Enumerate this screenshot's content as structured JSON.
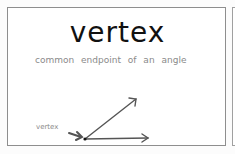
{
  "card": {
    "title": "vertex",
    "subtitle": "common endpoint of an angle",
    "diagram": {
      "label": "vertex",
      "label_pointer": "arrow-pointing-to-vertex",
      "vertex_point": {
        "x": 84,
        "y": 138
      },
      "rays": [
        {
          "name": "upper-ray",
          "to": {
            "x": 135,
            "y": 97
          }
        },
        {
          "name": "lower-ray",
          "to": {
            "x": 147,
            "y": 137
          }
        }
      ]
    }
  },
  "colors": {
    "title": "#111111",
    "subtitle": "#8a8a8a",
    "rays": "#555555",
    "border": "#8e8e8e"
  }
}
